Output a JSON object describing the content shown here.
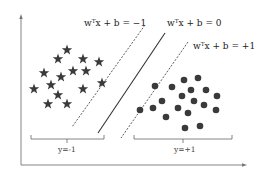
{
  "diagram": {
    "type": "svm-margin-illustration",
    "equations": {
      "negative_margin": "wᵀx + b = −1",
      "decision_boundary": "wᵀx + b = 0",
      "positive_margin": "wᵀx + b = +1"
    },
    "classes": {
      "negative": {
        "label": "y=-1",
        "marker": "star-icon",
        "color": "#333333"
      },
      "positive": {
        "label": "y=+1",
        "marker": "circle-icon",
        "color": "#333333"
      }
    },
    "stars": [
      [
        67,
        50
      ],
      [
        58,
        59
      ],
      [
        83,
        59
      ],
      [
        99,
        62
      ],
      [
        44,
        73
      ],
      [
        73,
        71
      ],
      [
        86,
        71
      ],
      [
        61,
        77
      ],
      [
        34,
        89
      ],
      [
        51,
        85
      ],
      [
        83,
        89
      ],
      [
        102,
        83
      ],
      [
        58,
        95
      ],
      [
        48,
        104
      ],
      [
        67,
        104
      ]
    ],
    "circles": [
      [
        155,
        86
      ],
      [
        172,
        87
      ],
      [
        184,
        80
      ],
      [
        198,
        78
      ],
      [
        191,
        90
      ],
      [
        206,
        90
      ],
      [
        217,
        96
      ],
      [
        182,
        96
      ],
      [
        194,
        101
      ],
      [
        162,
        101
      ],
      [
        153,
        108
      ],
      [
        178,
        108
      ],
      [
        204,
        105
      ],
      [
        140,
        110
      ],
      [
        188,
        113
      ],
      [
        216,
        110
      ],
      [
        166,
        117
      ],
      [
        185,
        128
      ],
      [
        200,
        126
      ]
    ],
    "colors": {
      "axis": "#777777",
      "lines": "#333333",
      "markers": "#3a3a3a"
    }
  }
}
